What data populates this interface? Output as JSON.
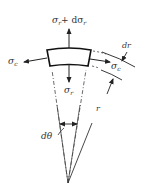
{
  "diagram": {
    "title": "",
    "labels": {
      "radial_stress_top": "σ",
      "radial_stress_top_sub": "r",
      "radial_stress_top_plus": "+ dσ",
      "radial_stress_top_plus_sub": "r",
      "radial_stress_bottom": "σ",
      "radial_stress_bottom_sub": "r",
      "circ_stress_left": "σ",
      "circ_stress_left_sub": "c",
      "circ_stress_right": "σ",
      "circ_stress_right_sub": "c",
      "thickness": "dr",
      "radius": "r",
      "angle": "dθ"
    },
    "colors": {
      "line": "#222222",
      "background": "#ffffff"
    }
  }
}
